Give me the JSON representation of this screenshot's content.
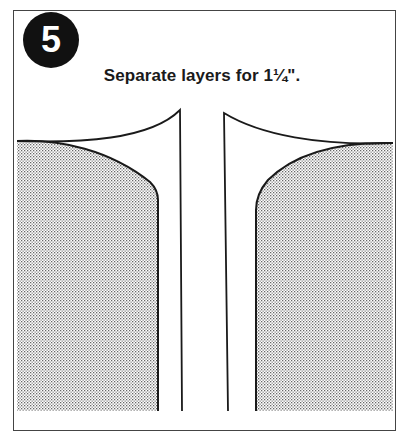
{
  "step": {
    "number": "5"
  },
  "caption": "Separate layers for 1¼\".",
  "illustration": {
    "description": "Two fabric layers separated, showing a 1¼ inch gap between folded edges",
    "colors": {
      "line": "#1a1a1a",
      "shade_dot": "#777777",
      "background": "#ffffff"
    }
  }
}
